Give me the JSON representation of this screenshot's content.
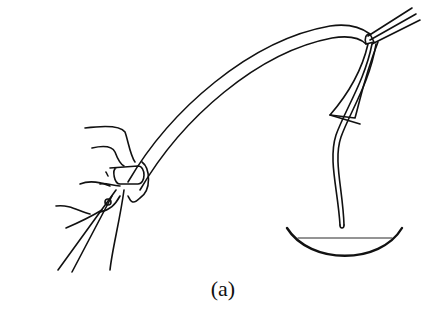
{
  "figure": {
    "caption": "(a)",
    "stroke_color": "#111111",
    "background": "#ffffff"
  }
}
